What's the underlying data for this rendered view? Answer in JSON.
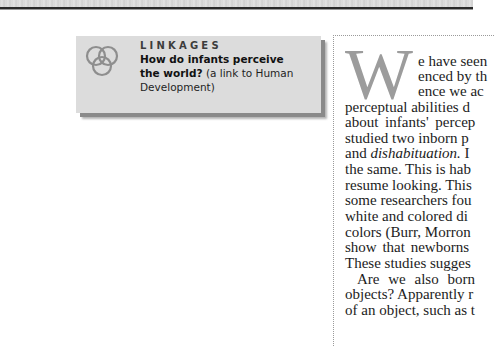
{
  "page": {
    "background": "#ffffff",
    "top_band_color": "#d9d9d9",
    "top_rule_color": "#2a2a2a"
  },
  "linkages": {
    "icon": "three-linked-circles-icon",
    "title": "LINKAGES",
    "question_bold_line1": "How do infants perceive",
    "question_bold_line2": "the world?",
    "question_note_line2": " (a link to Human",
    "question_note_line3": "Development)",
    "box_color": "#dcdcdc",
    "shadow_color": "#8a8a8a"
  },
  "article": {
    "dropcap": "W",
    "dropcap_color": "#9c9c9c",
    "lines": [
      "e have seen",
      "enced by th",
      "ence we ac",
      "perceptual abilities d",
      "about infants' percep",
      "studied two inborn p",
      "and ",
      "the same. This is hab",
      "resume looking. This",
      "some researchers fou",
      "white and colored di",
      "colors (Burr, Morron",
      "show that newborns",
      "These studies sugges",
      "Are we also born",
      "objects? Apparently r",
      "of an object, such as t"
    ],
    "line7_italic": "dishabituation.",
    "line7_tail": " I"
  }
}
